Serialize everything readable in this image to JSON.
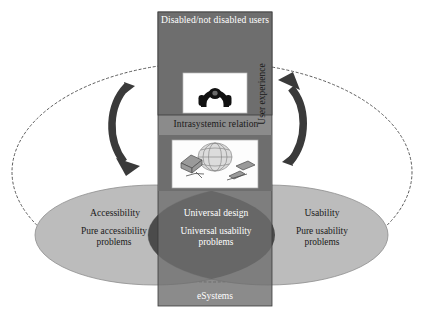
{
  "diagram": {
    "title_top_box": "Disabled/not disabled users",
    "title_bottom_box": "eSystems",
    "relation_label": "Intrasystemic relation",
    "side_label": "User experience",
    "left_ellipse": {
      "title": "Accessibility",
      "body_line1": "Pure accessibility",
      "body_line2": "problems"
    },
    "right_ellipse": {
      "title": "Usability",
      "body_line1": "Pure usability",
      "body_line2": "problems"
    },
    "center_lens": {
      "title": "Universal design",
      "body_line1": "Universal usability",
      "body_line2": "problems"
    },
    "icons": {
      "top_image": "headset-user-icon",
      "bottom_image": "globe-computer-devices-icon",
      "left_arrow": "curved-arrow-down-icon",
      "right_arrow": "curved-arrow-up-icon",
      "outer_boundary": "dotted-ellipse-boundary"
    },
    "colors": {
      "box_gray": "#6b6b6b",
      "ellipse_light": "#b9b9b9",
      "lens_dark": "#3d3d3d",
      "text_white": "#ffffff",
      "text_dark": "#1a1a1a",
      "arrow_dark": "#333333",
      "boundary_dotted": "#555555"
    }
  }
}
